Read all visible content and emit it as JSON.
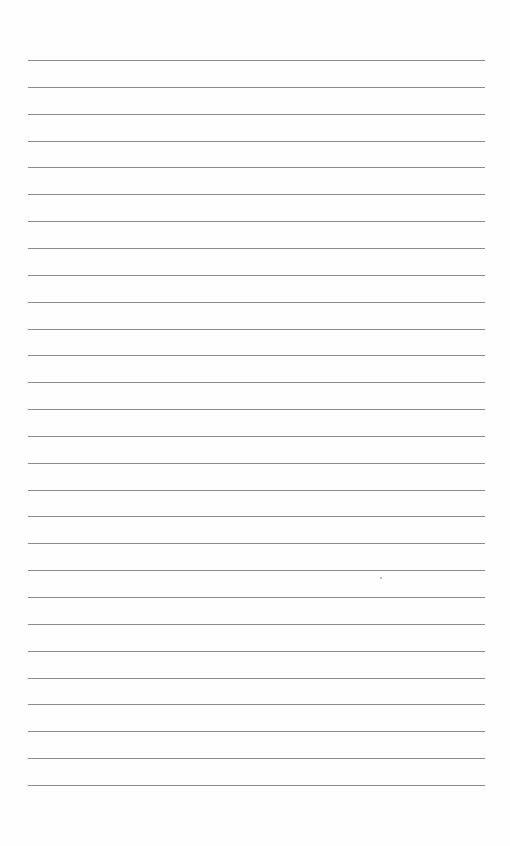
{
  "page": {
    "type": "lined-paper",
    "background": "#ffffff",
    "line_color": "#8a8a8a",
    "line_count": 28,
    "line_left": 28,
    "line_right": 485,
    "first_line_y": 60,
    "line_spacing": 26.85
  }
}
